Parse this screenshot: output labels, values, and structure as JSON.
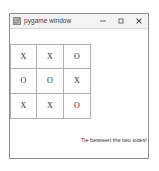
{
  "window": {
    "title": "pygame window",
    "app_icon": "pygame-app-icon",
    "controls": {
      "minimize": "minimize-icon",
      "maximize": "maximize-icon",
      "close": "close-icon"
    }
  },
  "game": {
    "board": [
      [
        "X",
        "X",
        "O"
      ],
      [
        "O",
        "O",
        "X"
      ],
      [
        "X",
        "X",
        "O"
      ]
    ],
    "status_message": "Tie between the two sides!"
  },
  "colors": {
    "window_border": "#8e8e8e",
    "titlebar_bg": "#f3f3f3",
    "client_bg": "#fefefe",
    "grid_line": "#b0b0b0",
    "mark_text": "#2f2f2f",
    "status_text": "#3a3a3a"
  }
}
